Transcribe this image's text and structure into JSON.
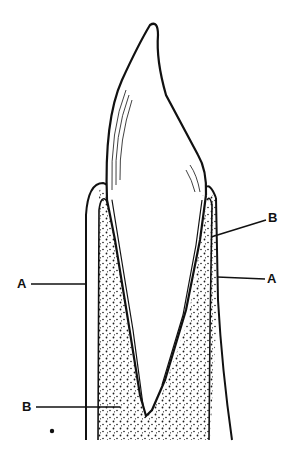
{
  "figure": {
    "ink_color": "#111111",
    "stipple_color": "#1a1a1a",
    "background": "#ffffff"
  },
  "labels": [
    {
      "id": "A-left",
      "text": "A",
      "x": 19,
      "y": 278
    },
    {
      "id": "A-right",
      "text": "A",
      "x": 268,
      "y": 275
    },
    {
      "id": "B-upper",
      "text": "B",
      "x": 269,
      "y": 212
    },
    {
      "id": "B-lower",
      "text": "B",
      "x": 23,
      "y": 401
    }
  ],
  "marks": [
    {
      "id": "dot",
      "x": 51,
      "y": 431
    }
  ]
}
